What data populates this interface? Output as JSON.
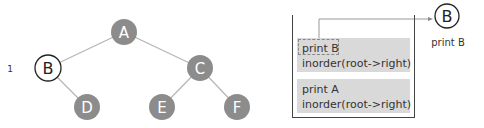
{
  "tree": {
    "nodes": [
      {
        "id": "A",
        "label": "A",
        "state": "unvisited"
      },
      {
        "id": "B",
        "label": "B",
        "state": "current"
      },
      {
        "id": "C",
        "label": "C",
        "state": "unvisited"
      },
      {
        "id": "D",
        "label": "D",
        "state": "unvisited"
      },
      {
        "id": "E",
        "label": "E",
        "state": "unvisited"
      },
      {
        "id": "F",
        "label": "F",
        "state": "unvisited"
      }
    ],
    "edges": [
      [
        "A",
        "B"
      ],
      [
        "A",
        "C"
      ],
      [
        "B",
        "D"
      ],
      [
        "C",
        "E"
      ],
      [
        "C",
        "F"
      ]
    ],
    "current_step_label": "1"
  },
  "call_stack": {
    "frames": [
      {
        "line1": "print B",
        "line2": "inorder(root->right)",
        "highlighted_line": "print B"
      },
      {
        "line1": "print A",
        "line2": "inorder(root->right)"
      }
    ]
  },
  "output": {
    "node_label": "B",
    "caption": "print B"
  },
  "colors": {
    "node_fill": "#8c8c8c",
    "current_node_stroke": "#222222",
    "edge": "#b5b5b5",
    "frame_fill": "#d9d9d9"
  }
}
